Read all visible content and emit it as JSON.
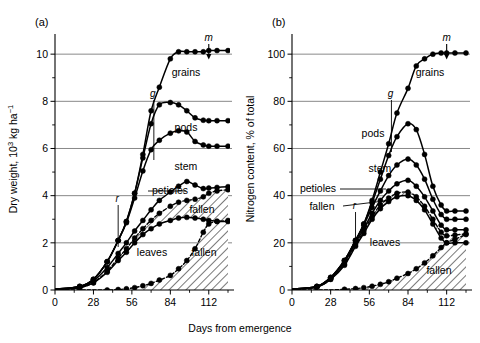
{
  "figure": {
    "xlabel": "Days from emergence",
    "panel_a_letter": "(a)",
    "panel_b_letter": "(b)"
  },
  "chart_data": [
    {
      "type": "area",
      "panel": "(a)",
      "title": "",
      "xlabel": "Days from emergence",
      "ylabel": "Dry weight, 10³ kg ha⁻¹",
      "ylabel_text": "Dry weight, 10",
      "ylabel_sup": "3",
      "ylabel_tail": " kg ha",
      "ylabel_sup2": "−1",
      "xlim": [
        0,
        126
      ],
      "ylim": [
        0,
        10.6
      ],
      "xticks": [
        0,
        28,
        56,
        84,
        112
      ],
      "xticklabels": [
        "0",
        "28",
        "56",
        "84",
        "112"
      ],
      "xminor": [
        14,
        42,
        70,
        98,
        126
      ],
      "yticks": [
        0,
        2,
        4,
        6,
        8,
        10
      ],
      "yticklabels": [
        "0",
        "2",
        "4",
        "6",
        "8",
        "10"
      ],
      "yminor": [
        1,
        3,
        5,
        7,
        9
      ],
      "grid": "horizontal",
      "stacked": true,
      "series": [
        {
          "name": "fallen leaves",
          "style": "dashed",
          "hatched": true,
          "x": [
            0,
            18,
            28,
            38,
            46,
            52,
            58,
            64,
            70,
            76,
            84,
            90,
            96,
            102,
            108,
            112,
            118,
            126
          ],
          "values": [
            0,
            0,
            0,
            0,
            0.02,
            0.05,
            0.1,
            0.18,
            0.28,
            0.42,
            0.62,
            0.9,
            1.25,
            1.75,
            2.45,
            2.8,
            2.9,
            2.95
          ]
        },
        {
          "name": "leaves",
          "style": "solid",
          "x": [
            0,
            18,
            28,
            38,
            46,
            52,
            58,
            64,
            70,
            76,
            84,
            90,
            96,
            102,
            108,
            112,
            118,
            126
          ],
          "values": [
            0.02,
            0.1,
            0.3,
            0.75,
            1.25,
            1.6,
            2.0,
            2.35,
            2.6,
            2.8,
            2.95,
            3.05,
            3.08,
            3.05,
            3.0,
            2.95,
            2.92,
            2.9
          ]
        },
        {
          "name": "fallen petioles",
          "style": "dashed",
          "hatched": true,
          "x": [
            0,
            18,
            28,
            38,
            46,
            52,
            58,
            64,
            70,
            76,
            84,
            90,
            96,
            102,
            108,
            112,
            118,
            126
          ],
          "values": [
            0.02,
            0.1,
            0.32,
            0.8,
            1.35,
            1.75,
            2.2,
            2.6,
            2.95,
            3.25,
            3.55,
            3.72,
            3.8,
            3.85,
            3.95,
            4.1,
            4.2,
            4.25
          ]
        },
        {
          "name": "petioles",
          "style": "solid",
          "x": [
            0,
            18,
            28,
            38,
            46,
            52,
            58,
            64,
            70,
            76,
            84,
            90,
            96,
            102,
            108,
            112,
            118,
            126
          ],
          "values": [
            0.03,
            0.12,
            0.38,
            0.95,
            1.55,
            2.0,
            2.5,
            2.95,
            3.4,
            3.8,
            4.15,
            4.4,
            4.6,
            4.45,
            4.3,
            4.32,
            4.35,
            4.38
          ]
        },
        {
          "name": "stem",
          "style": "solid",
          "x": [
            0,
            18,
            28,
            38,
            46,
            52,
            58,
            64,
            70,
            76,
            84,
            90,
            96,
            102,
            108,
            112,
            118,
            126
          ],
          "values": [
            0.03,
            0.15,
            0.45,
            1.2,
            2.1,
            2.85,
            3.9,
            5.05,
            5.95,
            6.35,
            6.65,
            6.75,
            6.7,
            6.3,
            6.15,
            6.1,
            6.1,
            6.1
          ]
        },
        {
          "name": "pods",
          "style": "solid",
          "x": [
            0,
            18,
            28,
            38,
            46,
            52,
            58,
            64,
            70,
            76,
            84,
            90,
            96,
            102,
            108,
            112,
            118,
            126
          ],
          "values": [
            0.03,
            0.15,
            0.45,
            1.2,
            2.1,
            2.9,
            4.1,
            5.6,
            7.05,
            7.85,
            7.95,
            7.85,
            7.6,
            7.3,
            7.2,
            7.18,
            7.18,
            7.18
          ]
        },
        {
          "name": "grains",
          "style": "solid",
          "x": [
            0,
            18,
            28,
            38,
            46,
            52,
            58,
            64,
            70,
            76,
            84,
            90,
            96,
            102,
            108,
            112,
            118,
            126
          ],
          "values": [
            0.03,
            0.15,
            0.45,
            1.2,
            2.1,
            2.9,
            4.1,
            5.75,
            7.6,
            8.6,
            9.8,
            10.1,
            10.1,
            10.1,
            10.1,
            10.15,
            10.15,
            10.15
          ]
        }
      ],
      "annotations": [
        {
          "text": "m",
          "x": 112,
          "kind": "arrow-down"
        },
        {
          "text": "g",
          "x": 72,
          "kind": "vline"
        },
        {
          "text": "r",
          "x": 46,
          "kind": "vline"
        }
      ],
      "series_labels": [
        "grains",
        "pods",
        "stem",
        "petioles",
        "fallen",
        "leaves",
        "fallen"
      ]
    },
    {
      "type": "area",
      "panel": "(b)",
      "title": "",
      "xlabel": "Days from emergence",
      "ylabel": "Nitrogen content, % of total",
      "xlim": [
        0,
        126
      ],
      "ylim": [
        0,
        106
      ],
      "xticks": [
        0,
        28,
        56,
        84,
        112
      ],
      "xticklabels": [
        "0",
        "28",
        "56",
        "84",
        "112"
      ],
      "xminor": [
        14,
        42,
        70,
        98,
        126
      ],
      "yticks": [
        0,
        20,
        40,
        60,
        80,
        100
      ],
      "yticklabels": [
        "0",
        "20",
        "40",
        "60",
        "80",
        "100"
      ],
      "yminor": [
        10,
        30,
        50,
        70,
        90
      ],
      "grid": "horizontal",
      "stacked": true,
      "series": [
        {
          "name": "fallen leaves",
          "style": "dashed",
          "hatched": true,
          "x": [
            0,
            18,
            28,
            38,
            46,
            52,
            58,
            64,
            70,
            76,
            84,
            90,
            96,
            102,
            108,
            112,
            118,
            126
          ],
          "values": [
            0,
            0,
            0,
            0.3,
            0.6,
            1.0,
            1.6,
            2.4,
            3.5,
            5.0,
            7.0,
            9.0,
            11.5,
            14.5,
            18.0,
            20.0,
            21.5,
            23.5
          ]
        },
        {
          "name": "leaves",
          "style": "solid",
          "x": [
            0,
            18,
            28,
            38,
            46,
            52,
            58,
            64,
            70,
            76,
            84,
            90,
            96,
            102,
            108,
            112,
            118,
            126
          ],
          "values": [
            0.3,
            1.2,
            4.5,
            10.5,
            18.5,
            24.0,
            30.0,
            34.5,
            37.5,
            39.5,
            40.0,
            38.0,
            34.0,
            28.0,
            22.0,
            20.0,
            20.0,
            20.0
          ]
        },
        {
          "name": "fallen petioles",
          "style": "dashed",
          "hatched": true,
          "x": [
            0,
            18,
            28,
            38,
            46,
            52,
            58,
            64,
            70,
            76,
            84,
            90,
            96,
            102,
            108,
            112,
            118,
            126
          ],
          "values": [
            0.3,
            1.3,
            4.7,
            11.0,
            19.2,
            25.0,
            31.2,
            36.0,
            39.0,
            41.0,
            41.5,
            39.5,
            35.5,
            30.0,
            24.5,
            23.0,
            23.3,
            23.8
          ]
        },
        {
          "name": "petioles",
          "style": "solid",
          "x": [
            0,
            18,
            28,
            38,
            46,
            52,
            58,
            64,
            70,
            76,
            84,
            90,
            96,
            102,
            108,
            112,
            118,
            126
          ],
          "values": [
            0.4,
            1.4,
            5.0,
            11.8,
            20.0,
            26.0,
            32.5,
            38.0,
            42.0,
            45.0,
            46.5,
            44.0,
            39.5,
            33.5,
            27.5,
            25.5,
            25.5,
            25.5
          ]
        },
        {
          "name": "stem",
          "style": "solid",
          "x": [
            0,
            18,
            28,
            38,
            46,
            52,
            58,
            64,
            70,
            76,
            84,
            90,
            96,
            102,
            108,
            112,
            118,
            126
          ],
          "values": [
            0.4,
            1.5,
            5.3,
            12.5,
            21.0,
            27.5,
            35.0,
            42.0,
            48.5,
            53.0,
            55.5,
            53.0,
            47.0,
            38.5,
            32.0,
            30.0,
            30.0,
            30.0
          ]
        },
        {
          "name": "pods",
          "style": "solid",
          "x": [
            0,
            18,
            28,
            38,
            46,
            52,
            58,
            64,
            70,
            76,
            84,
            90,
            96,
            102,
            108,
            112,
            118,
            126
          ],
          "values": [
            0.4,
            1.5,
            5.3,
            12.5,
            21.0,
            28.0,
            37.0,
            47.0,
            57.0,
            65.0,
            70.5,
            68.0,
            57.5,
            44.0,
            36.0,
            33.5,
            33.5,
            33.5
          ]
        },
        {
          "name": "grains",
          "style": "solid",
          "x": [
            0,
            18,
            28,
            38,
            46,
            52,
            58,
            64,
            70,
            76,
            84,
            90,
            96,
            102,
            108,
            112,
            118,
            126
          ],
          "values": [
            0.4,
            1.5,
            5.3,
            12.5,
            21.0,
            28.0,
            38.0,
            50.0,
            62.0,
            75.0,
            85.5,
            95.0,
            98.0,
            100.0,
            100.5,
            100.5,
            100.5,
            100.5
          ]
        }
      ],
      "annotations": [
        {
          "text": "m",
          "x": 112,
          "kind": "arrow-down"
        },
        {
          "text": "g",
          "x": 72,
          "kind": "vline"
        },
        {
          "text": "r",
          "x": 46,
          "kind": "vline"
        }
      ],
      "series_labels": [
        "grains",
        "pods",
        "stem",
        "petioles",
        "fallen",
        "leaves",
        "fallen"
      ]
    }
  ],
  "panel_a": {
    "letter": "(a)",
    "ylabel_main": "Dry weight, 10",
    "ylabel_sup": "3",
    "ylabel_unit": " kg ha",
    "ylabel_unit_sup": "−1",
    "labels": {
      "grains": "grains",
      "pods": "pods",
      "stem": "stem",
      "petioles": "petioles",
      "fallen_petioles": "fallen",
      "leaves": "leaves",
      "fallen_leaves": "fallen",
      "m": "m",
      "g": "g",
      "r": "r"
    },
    "yticklabels": [
      "0",
      "2",
      "4",
      "6",
      "8",
      "10"
    ],
    "xticklabels": [
      "0",
      "28",
      "56",
      "84",
      "112"
    ]
  },
  "panel_b": {
    "letter": "(b)",
    "ylabel": "Nitrogen content, % of total",
    "labels": {
      "grains": "grains",
      "pods": "pods",
      "stem": "stem",
      "petioles": "petioles",
      "fallen_petioles": "fallen",
      "leaves": "leaves",
      "fallen_leaves": "fallen",
      "m": "m",
      "g": "g",
      "r": "r"
    },
    "yticklabels": [
      "0",
      "20",
      "40",
      "60",
      "80",
      "100"
    ],
    "xticklabels": [
      "0",
      "28",
      "56",
      "84",
      "112"
    ]
  }
}
